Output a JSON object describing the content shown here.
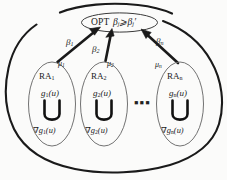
{
  "figure": {
    "type": "diagram",
    "colors": {
      "stroke": "#1a1a1a",
      "thin_stroke": "#5a5a5a",
      "background": "#fbfbfa",
      "text": "#1a1a1a"
    }
  },
  "opt_node": {
    "label": "OPT",
    "formula_beta": "β",
    "formula_sub": "j",
    "formula_relation": "⩾",
    "formula_beta2": "β",
    "formula_sub2": "j",
    "formula_prime": "′",
    "formula_full": "βj ⩾ βj′"
  },
  "arrows": [
    {
      "name": "arrow-1",
      "beta_symbol": "β",
      "beta_sub": "1",
      "mu_symbol": "μ",
      "mu_sub": "1"
    },
    {
      "name": "arrow-2",
      "beta_symbol": "β",
      "beta_sub": "2",
      "mu_symbol": "μ",
      "mu_sub": "2"
    },
    {
      "name": "arrow-n",
      "beta_symbol": "β",
      "beta_sub": "n",
      "mu_symbol": "μ",
      "mu_sub": "n"
    }
  ],
  "ra_nodes": [
    {
      "name": "ra-1",
      "title_base": "RA",
      "title_sub": "1",
      "g_base": "g",
      "g_sub": "1",
      "g_arg": "(u)",
      "grad_symbol": "∇",
      "grad_base": "g",
      "grad_sub": "1",
      "grad_arg": "(u)"
    },
    {
      "name": "ra-2",
      "title_base": "RA",
      "title_sub": "2",
      "g_base": "g",
      "g_sub": "2",
      "g_arg": "(u)",
      "grad_symbol": "∇",
      "grad_base": "g",
      "grad_sub": "2",
      "grad_arg": "(u)"
    },
    {
      "name": "ra-n",
      "title_base": "RA",
      "title_sub": "n",
      "g_base": "g",
      "g_sub": "n",
      "g_arg": "(u)",
      "grad_symbol": "∇",
      "grad_base": "g",
      "grad_sub": "n",
      "grad_arg": "(u)"
    }
  ],
  "ellipsis": "▪▪▪"
}
